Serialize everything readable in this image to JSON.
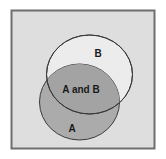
{
  "diagram": {
    "type": "venn",
    "sets": [
      {
        "id": "B",
        "label": "B",
        "fill": "#ececec",
        "stroke": "#3a3a3a"
      },
      {
        "id": "A",
        "label": "A",
        "fill": "#ababab",
        "stroke": "#3a3a3a"
      }
    ],
    "intersection": {
      "label": "A and B"
    },
    "colors": {
      "background": "#dedede",
      "frame": "#6e6e6e"
    }
  }
}
